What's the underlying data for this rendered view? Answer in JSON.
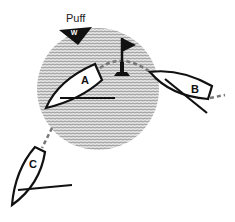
{
  "diagram": {
    "title": "",
    "puff_label": "Puff",
    "wind_label": "W",
    "boats": [
      {
        "id": "A",
        "label": "A"
      },
      {
        "id": "B",
        "label": "B"
      },
      {
        "id": "C",
        "label": "C"
      }
    ],
    "elements": [
      "puff-zone",
      "wind-arrow",
      "mark-flag",
      "boat-track"
    ],
    "colors": {
      "puff_fill": "#bdbdbd",
      "ink": "#111111",
      "track": "#777777",
      "background": "#ffffff"
    }
  }
}
